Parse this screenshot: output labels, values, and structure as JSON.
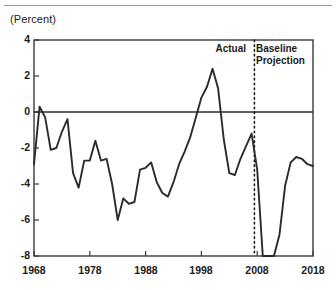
{
  "figure": {
    "unit_label": "(Percent)",
    "annotations": {
      "actual": "Actual",
      "baseline_line1": "Baseline",
      "baseline_line2": "Projection"
    }
  },
  "chart_data": {
    "type": "line",
    "title": "",
    "subtitle": "",
    "xlabel": "",
    "ylabel": "(Percent)",
    "xlim": [
      1968,
      2018
    ],
    "ylim": [
      -8,
      4
    ],
    "grid": false,
    "legend_position": "none",
    "yticks": [
      "4",
      "2",
      "0",
      "-2",
      "-4",
      "-6",
      "-8"
    ],
    "ytick_values": [
      4,
      2,
      0,
      -2,
      -4,
      -6,
      -8
    ],
    "xticks": [
      "1968",
      "1978",
      "1988",
      "1998",
      "2008",
      "2018"
    ],
    "xtick_values": [
      1968,
      1978,
      1988,
      1998,
      2008,
      2018
    ],
    "zero_line": 0,
    "divider": {
      "x": 2007.5,
      "style": "dotted",
      "left_label": "Actual",
      "right_label": "Baseline Projection"
    },
    "line_color": "#2b2b2b",
    "axis_color": "#3a3a3a",
    "series": [
      {
        "name": "Deficit or Surplus as Percent of GDP",
        "x": [
          1968,
          1969,
          1970,
          1971,
          1972,
          1973,
          1974,
          1975,
          1976,
          1977,
          1978,
          1979,
          1980,
          1981,
          1982,
          1983,
          1984,
          1985,
          1986,
          1987,
          1988,
          1989,
          1990,
          1991,
          1992,
          1993,
          1994,
          1995,
          1996,
          1997,
          1998,
          1999,
          2000,
          2001,
          2002,
          2003,
          2004,
          2005,
          2006,
          2007,
          2008,
          2009,
          2010,
          2011,
          2012,
          2013,
          2014,
          2015,
          2016,
          2017,
          2018
        ],
        "values": [
          -2.9,
          0.3,
          -0.3,
          -2.1,
          -2.0,
          -1.1,
          -0.4,
          -3.4,
          -4.2,
          -2.7,
          -2.7,
          -1.6,
          -2.7,
          -2.6,
          -4.0,
          -6.0,
          -4.8,
          -5.1,
          -5.0,
          -3.2,
          -3.1,
          -2.8,
          -3.9,
          -4.5,
          -4.7,
          -3.9,
          -2.9,
          -2.2,
          -1.4,
          -0.3,
          0.8,
          1.4,
          2.4,
          1.3,
          -1.5,
          -3.4,
          -3.5,
          -2.6,
          -1.9,
          -1.2,
          -3.2,
          -9.8,
          -8.7,
          -8.4,
          -6.8,
          -4.1,
          -2.8,
          -2.5,
          -2.6,
          -2.9,
          -3.0
        ]
      }
    ],
    "notable_points": {
      "peak_surplus": {
        "year": 2000,
        "value": 2.4
      },
      "trough_deficit_actual": {
        "year": 1983,
        "value": -6.0
      }
    }
  }
}
